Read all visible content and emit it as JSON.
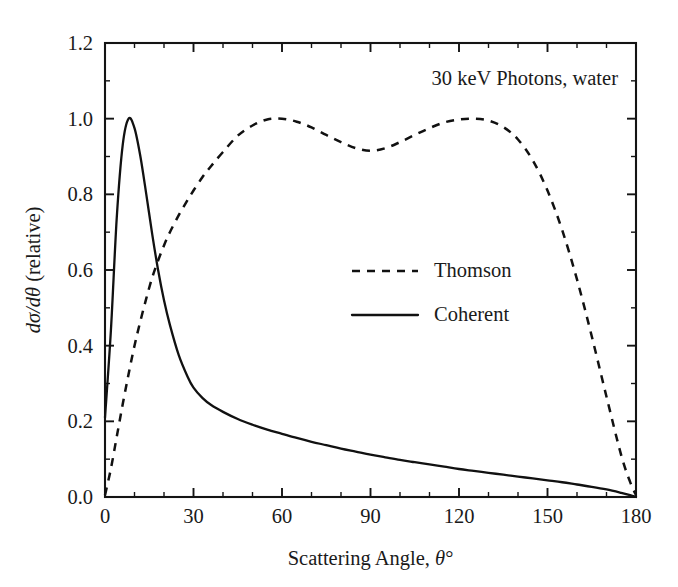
{
  "chart_data": {
    "type": "line",
    "title": "",
    "annotation": "30 keV Photons, water",
    "xlabel": "Scattering Angle, θ°",
    "ylabel": "dσ/dθ (relative)",
    "ylabel_parts": {
      "italic_lead": "dσ/d",
      "italic_theta": "θ",
      "roman_tail": " (relative)"
    },
    "xlabel_parts": {
      "roman_lead": "Scattering Angle, ",
      "italic_theta": "θ",
      "degree": "°"
    },
    "xlim": [
      0,
      180
    ],
    "ylim": [
      0.0,
      1.2
    ],
    "xticks": [
      0,
      30,
      60,
      90,
      120,
      150,
      180
    ],
    "xtick_labels": [
      "0",
      "30",
      "60",
      "90",
      "120",
      "150",
      "180"
    ],
    "xticks_minor_step": 10,
    "yticks": [
      0.0,
      0.2,
      0.4,
      0.6,
      0.8,
      1.0,
      1.2
    ],
    "ytick_labels": [
      "0.0",
      "0.2",
      "0.4",
      "0.6",
      "0.8",
      "1.0",
      "1.2"
    ],
    "yticks_minor_step": 0.1,
    "grid": false,
    "frame": "box-all-sides-inward-ticks",
    "legend_position": "center",
    "legend": [
      {
        "label": "Thomson",
        "style": "dashed"
      },
      {
        "label": "Coherent",
        "style": "solid"
      }
    ],
    "x": [
      0,
      2,
      4,
      6,
      8,
      10,
      12,
      14,
      16,
      18,
      20,
      22,
      25,
      28,
      30,
      33,
      36,
      40,
      45,
      50,
      55,
      60,
      65,
      70,
      75,
      80,
      85,
      90,
      95,
      100,
      105,
      110,
      115,
      120,
      125,
      130,
      135,
      140,
      145,
      150,
      155,
      160,
      165,
      170,
      175,
      178,
      180
    ],
    "series": [
      {
        "name": "Thomson",
        "style": "dashed",
        "values": [
          0.005,
          0.075,
          0.16,
          0.245,
          0.325,
          0.4,
          0.465,
          0.525,
          0.58,
          0.625,
          0.665,
          0.7,
          0.745,
          0.785,
          0.81,
          0.845,
          0.875,
          0.912,
          0.955,
          0.982,
          0.998,
          1.0,
          0.992,
          0.977,
          0.957,
          0.938,
          0.922,
          0.915,
          0.922,
          0.938,
          0.957,
          0.975,
          0.99,
          0.998,
          1.0,
          0.995,
          0.978,
          0.945,
          0.89,
          0.81,
          0.705,
          0.575,
          0.425,
          0.265,
          0.11,
          0.04,
          0.005
        ]
      },
      {
        "name": "Coherent",
        "style": "solid",
        "values": [
          0.21,
          0.44,
          0.74,
          0.93,
          1.0,
          0.975,
          0.9,
          0.8,
          0.695,
          0.6,
          0.52,
          0.455,
          0.375,
          0.318,
          0.289,
          0.262,
          0.243,
          0.225,
          0.206,
          0.191,
          0.178,
          0.167,
          0.156,
          0.146,
          0.137,
          0.128,
          0.12,
          0.112,
          0.105,
          0.098,
          0.092,
          0.086,
          0.08,
          0.074,
          0.069,
          0.064,
          0.059,
          0.054,
          0.049,
          0.044,
          0.039,
          0.033,
          0.027,
          0.02,
          0.011,
          0.005,
          0.0
        ]
      }
    ]
  },
  "colors": {
    "ink": "#141414",
    "background": "#ffffff"
  }
}
